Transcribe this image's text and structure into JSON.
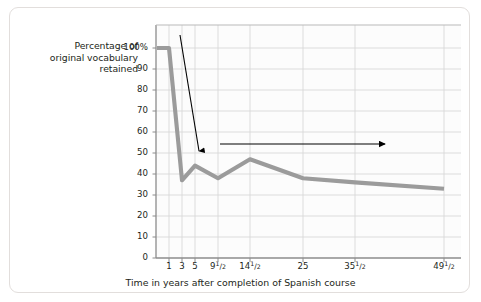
{
  "figure": {
    "border_color": "#e2dedc",
    "background": "#ffffff"
  },
  "yaxis": {
    "title": "Percentage of\noriginal vocabulary\nretained",
    "title_line1": "Percentage of",
    "title_line2": "original vocabulary",
    "title_line3": "retained",
    "ticks": [
      "100%",
      "90",
      "80",
      "70",
      "60",
      "50",
      "40",
      "30",
      "20",
      "10",
      "0"
    ]
  },
  "xaxis": {
    "title": "Time in years after completion of Spanish course",
    "ticks": [
      {
        "whole": "1",
        "num": "",
        "den": ""
      },
      {
        "whole": "3",
        "num": "",
        "den": ""
      },
      {
        "whole": "5",
        "num": "",
        "den": ""
      },
      {
        "whole": "9",
        "num": "1",
        "den": "2"
      },
      {
        "whole": "14",
        "num": "1",
        "den": "2"
      },
      {
        "whole": "25",
        "num": "",
        "den": ""
      },
      {
        "whole": "35",
        "num": "1",
        "den": "2"
      },
      {
        "whole": "49",
        "num": "1",
        "den": "2"
      }
    ]
  },
  "annotations": [
    {
      "id": "retention-drops",
      "text": "Retention\ndrops,"
    },
    {
      "id": "levels-off",
      "text": "then levels off"
    }
  ],
  "colors": {
    "line": "#9b9b9b",
    "grid": "#d9d9d9",
    "axis": "#8c8c8c",
    "arrow": "#000000",
    "text": "#231f20"
  },
  "chart_data": {
    "type": "line",
    "title": "",
    "xlabel": "Time in years after completion of Spanish course",
    "ylabel": "Percentage of original vocabulary retained",
    "x": [
      1,
      3,
      5,
      9.5,
      14.5,
      25,
      35.5,
      49.5
    ],
    "x_labels": [
      "1",
      "3",
      "5",
      "9 1/2",
      "14 1/2",
      "25",
      "35 1/2",
      "49 1/2"
    ],
    "values": [
      100,
      37,
      44,
      38,
      47,
      38,
      36,
      33
    ],
    "series": [
      {
        "name": "Percentage of original vocabulary retained",
        "values": [
          100,
          37,
          44,
          38,
          47,
          38,
          36,
          33
        ]
      }
    ],
    "ylim": [
      0,
      100
    ],
    "yticks": [
      0,
      10,
      20,
      30,
      40,
      50,
      60,
      70,
      80,
      90,
      100
    ],
    "grid": true,
    "legend": "none",
    "annotations": [
      "Retention drops,",
      "then levels off"
    ]
  }
}
